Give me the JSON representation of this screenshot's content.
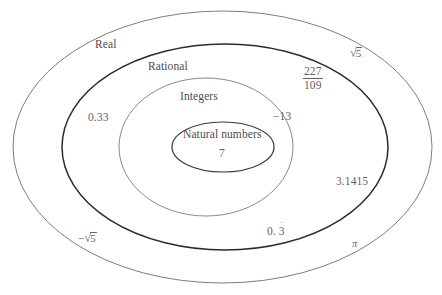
{
  "diagram": {
    "title_text": "",
    "type": "nested-venn-ellipses",
    "sets": [
      {
        "id": "real",
        "label": "Real",
        "stroke_color": "#6e6e6e",
        "stroke_width": 0.9,
        "cx": 222.5,
        "cy": 147,
        "rx": 209.5,
        "ry": 136
      },
      {
        "id": "rational",
        "label": "Rational",
        "stroke_color": "#2b2b2b",
        "stroke_width": 1.5,
        "cx": 225,
        "cy": 147,
        "rx": 163,
        "ry": 103
      },
      {
        "id": "integers",
        "label": "Integers",
        "stroke_color": "#7a7a7a",
        "stroke_width": 0.9,
        "cx": 206,
        "cy": 147,
        "rx": 87,
        "ry": 69
      },
      {
        "id": "natural",
        "label": "Natural numbers",
        "stroke_color": "#3a3a3a",
        "stroke_width": 1.2,
        "cx": 223,
        "cy": 147,
        "rx": 51,
        "ry": 25
      }
    ],
    "members": [
      {
        "id": "natural-example",
        "text": "7",
        "kind": "plain"
      },
      {
        "id": "integers-example",
        "text": "−13",
        "kind": "plain"
      },
      {
        "id": "rational-decimal",
        "text": "0.33",
        "kind": "plain"
      },
      {
        "id": "rational-fraction",
        "numerator": "227",
        "denominator": "109",
        "kind": "fraction"
      },
      {
        "id": "rational-repeating",
        "prefix": "0. ",
        "digit": "3",
        "kind": "repeating-decimal"
      },
      {
        "id": "irrational-sqrt5",
        "sign": "",
        "radicand": "5",
        "kind": "radical"
      },
      {
        "id": "irrational-neg-sqrt5",
        "sign": "−",
        "radicand": "5",
        "kind": "radical"
      },
      {
        "id": "irrational-pi-approx",
        "text": "3.1415",
        "kind": "plain"
      },
      {
        "id": "irrational-pi",
        "text": "π",
        "kind": "greek"
      }
    ],
    "colors": {
      "background": "#ffffff",
      "real_stroke": "#6e6e6e",
      "rational_stroke": "#2b2b2b",
      "integers_stroke": "#7a7a7a",
      "natural_stroke": "#3a3a3a",
      "text": "#5b5b5b"
    }
  }
}
